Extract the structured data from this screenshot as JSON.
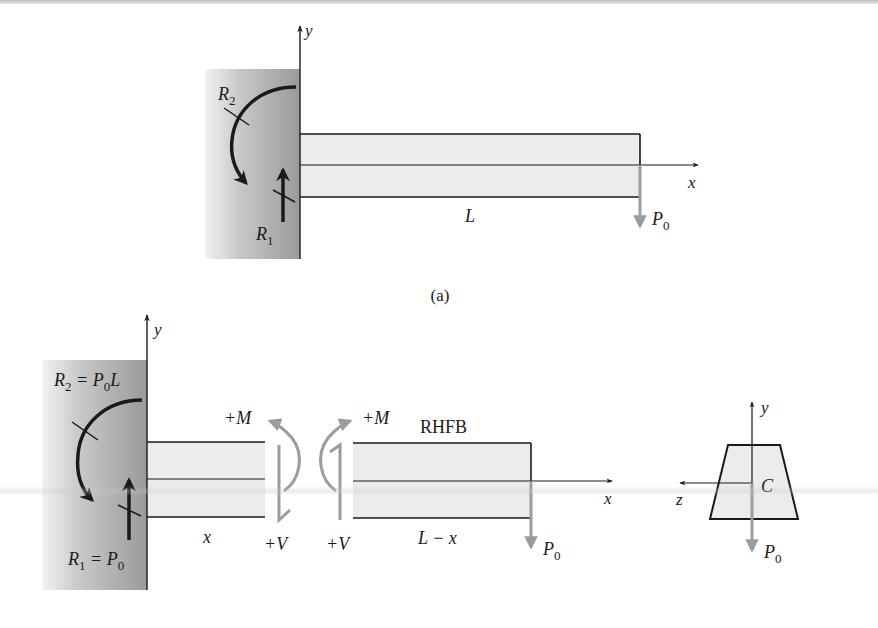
{
  "figure_a": {
    "caption": "(a)",
    "axis_y_label": "y",
    "axis_x_label": "x",
    "reaction_moment": {
      "symbol": "R",
      "subscript": "2"
    },
    "reaction_force": {
      "symbol": "R",
      "subscript": "1"
    },
    "length_label": "L",
    "load": {
      "symbol": "P",
      "subscript": "0"
    }
  },
  "figure_b": {
    "axis_y_label": "y",
    "axis_x_label": "x",
    "reaction_moment": {
      "symbol": "R",
      "subscript": "2",
      "equals": " = P",
      "eq_subscript": "0",
      "tail": "L"
    },
    "reaction_force": {
      "symbol": "R",
      "subscript": "1",
      "equals": " = P",
      "eq_subscript": "0"
    },
    "left_segment_label": "x",
    "right_segment_label": "L − x",
    "moment_left": "+M",
    "moment_right": "+M",
    "shear_left": "+V",
    "shear_right": "+V",
    "free_body_label": "RHFB",
    "load": {
      "symbol": "P",
      "subscript": "0"
    }
  },
  "cross_section": {
    "axis_y_label": "y",
    "axis_z_label": "z",
    "centroid_label": "C",
    "load": {
      "symbol": "P",
      "subscript": "0"
    }
  },
  "colors": {
    "wall_dark": "#9a9a9a",
    "wall_light": "#e9e9e9",
    "beam_fill": "#ececec",
    "line": "#1a1a1a",
    "grey_arrow": "#9c9c9c"
  }
}
